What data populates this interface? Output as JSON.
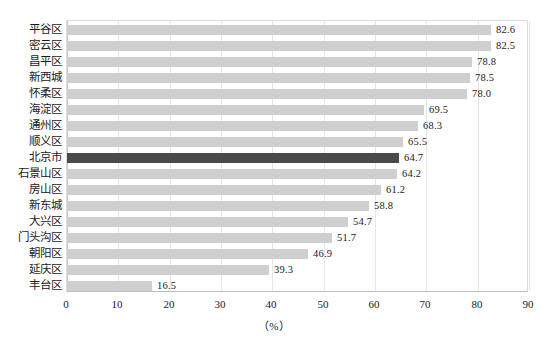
{
  "chart_data": {
    "type": "bar",
    "orientation": "horizontal",
    "title": "",
    "subtitle": "",
    "xlabel": "（%）",
    "ylabel": "",
    "xlim": [
      0,
      90
    ],
    "xticks": [
      0,
      10,
      20,
      30,
      40,
      50,
      60,
      70,
      80,
      90
    ],
    "xtick_labels": [
      "0",
      "10",
      "20",
      "30",
      "40",
      "50",
      "60",
      "70",
      "80",
      "90"
    ],
    "grid": true,
    "grid_axis": "x",
    "legend": "none",
    "value_label_format": "one-decimal",
    "categories": [
      "平谷区",
      "密云区",
      "昌平区",
      "新西城",
      "怀柔区",
      "海淀区",
      "通州区",
      "顺义区",
      "北京市",
      "石景山区",
      "房山区",
      "新东城",
      "大兴区",
      "门头沟区",
      "朝阳区",
      "延庆区",
      "丰台区"
    ],
    "values": [
      82.6,
      82.5,
      78.8,
      78.5,
      78.0,
      69.5,
      68.3,
      65.5,
      64.7,
      64.2,
      61.2,
      58.8,
      54.7,
      51.7,
      46.9,
      39.3,
      16.5
    ],
    "value_labels": [
      "82.6",
      "82.5",
      "78.8",
      "78.5",
      "78.0",
      "69.5",
      "68.3",
      "65.5",
      "64.7",
      "64.2",
      "61.2",
      "58.8",
      "54.7",
      "51.7",
      "46.9",
      "39.3",
      "16.5"
    ],
    "highlight_index": 8,
    "highlight_category": "北京市",
    "colors": {
      "bar": "#cfcfcf",
      "bar_highlight": "#4a4a4a",
      "gridline": "#e6e6e6",
      "axis": "#bdbdbd",
      "text": "#1a1a1a",
      "background": "#ffffff"
    }
  }
}
